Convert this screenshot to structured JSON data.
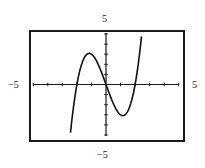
{
  "window": {
    "xmin_label": "−5",
    "xmax_label": "5",
    "ymin_label": "−5",
    "ymax_label": "5"
  },
  "colors": {
    "frame": "#1a1a1a",
    "axis": "#1a1a1a",
    "curve": "#111111",
    "background": "#ffffff"
  },
  "chart_data": {
    "type": "line",
    "title": "",
    "xlabel": "",
    "ylabel": "",
    "function": "y = x^3 - 4x",
    "xlim": [
      -5,
      5
    ],
    "ylim": [
      -5,
      5
    ],
    "xscl": 1,
    "yscl": 1,
    "grid": false,
    "legend": null,
    "tick_labels": {
      "left": "-5",
      "right": "5",
      "top": "5",
      "bottom": "-5"
    },
    "key_points": {
      "x_intercepts": [
        -2,
        0,
        2
      ],
      "local_max": [
        -1.15,
        3.08
      ],
      "local_min": [
        1.15,
        -3.08
      ]
    },
    "series": [
      {
        "name": "f(x)",
        "x": [
          -2.46,
          -2.25,
          -2.0,
          -1.75,
          -1.5,
          -1.15,
          -1.0,
          -0.75,
          -0.5,
          -0.25,
          0.0,
          0.25,
          0.5,
          0.75,
          1.0,
          1.15,
          1.5,
          1.75,
          2.0,
          2.25,
          2.46
        ],
        "y": [
          -5.0,
          -2.39,
          0.0,
          1.64,
          2.63,
          3.08,
          3.0,
          2.58,
          1.88,
          0.98,
          0.0,
          -0.98,
          -1.88,
          -2.58,
          -3.0,
          -3.08,
          -2.63,
          -1.64,
          0.0,
          2.39,
          5.0
        ]
      }
    ]
  }
}
